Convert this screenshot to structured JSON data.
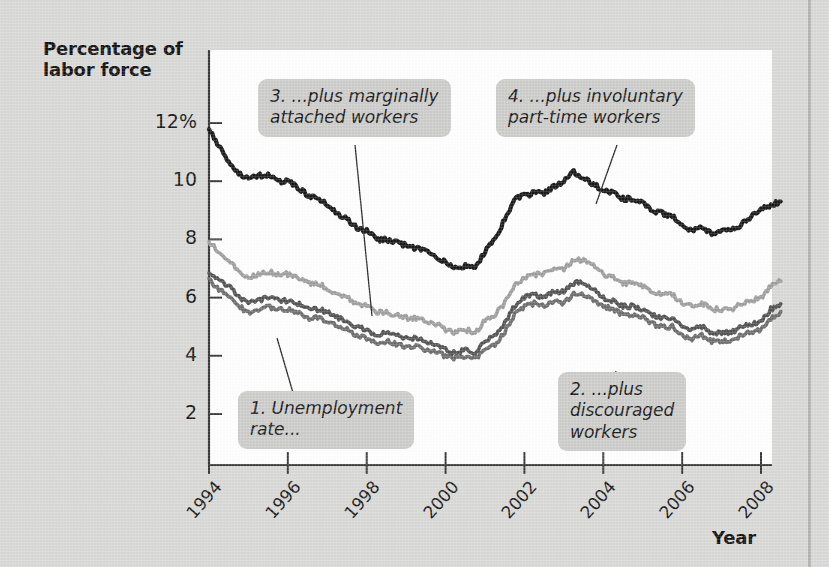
{
  "figure": {
    "background_color": "#d9d9d7",
    "plot_background_color": "#ffffff"
  },
  "axes": {
    "y_title": "Percentage of\nlabor force",
    "x_title": "Year"
  },
  "callouts": [
    {
      "id": "callout-1",
      "text": "1. Unemployment\nrate..."
    },
    {
      "id": "callout-2",
      "text": "2. ...plus\ndiscouraged\nworkers"
    },
    {
      "id": "callout-3",
      "text": "3. ...plus marginally\nattached workers"
    },
    {
      "id": "callout-4",
      "text": "4. ...plus involuntary\npart-time workers"
    }
  ],
  "chart_data": {
    "type": "line",
    "title": "",
    "subtitle": "",
    "xlabel": "Year",
    "ylabel": "Percentage of labor force",
    "xlim": [
      1994.0,
      2008.75
    ],
    "ylim": [
      0.4,
      12.4
    ],
    "ytick_labels": [
      "12%",
      "10",
      "8",
      "6",
      "4",
      "2"
    ],
    "yticks": [
      12,
      10,
      8,
      6,
      4,
      2
    ],
    "xticks": [
      1994,
      1996,
      1998,
      2000,
      2002,
      2004,
      2006,
      2008
    ],
    "xtick_labels": [
      "1994",
      "1996",
      "1998",
      "2000",
      "2002",
      "2004",
      "2006",
      "2008"
    ],
    "grid": false,
    "legend": "callout-annotations",
    "x": [
      1994.0,
      1994.25,
      1994.5,
      1994.75,
      1995.0,
      1995.25,
      1995.5,
      1995.75,
      1996.0,
      1996.25,
      1996.5,
      1996.75,
      1997.0,
      1997.25,
      1997.5,
      1997.75,
      1998.0,
      1998.25,
      1998.5,
      1998.75,
      1999.0,
      1999.25,
      1999.5,
      1999.75,
      2000.0,
      2000.25,
      2000.5,
      2000.75,
      2001.0,
      2001.25,
      2001.5,
      2001.75,
      2002.0,
      2002.25,
      2002.5,
      2002.75,
      2003.0,
      2003.25,
      2003.5,
      2003.75,
      2004.0,
      2004.25,
      2004.5,
      2004.75,
      2005.0,
      2005.25,
      2005.5,
      2005.75,
      2006.0,
      2006.25,
      2006.5,
      2006.75,
      2007.0,
      2007.25,
      2007.5,
      2007.75,
      2008.0,
      2008.25,
      2008.5
    ],
    "series": [
      {
        "name": "1. Unemployment rate (U-3)",
        "color": "#6e6e6e",
        "values": [
          6.6,
          6.3,
          6.1,
          5.7,
          5.5,
          5.6,
          5.7,
          5.6,
          5.6,
          5.5,
          5.3,
          5.3,
          5.2,
          5.0,
          4.9,
          4.7,
          4.6,
          4.4,
          4.5,
          4.4,
          4.3,
          4.3,
          4.2,
          4.1,
          4.0,
          3.9,
          4.0,
          3.9,
          4.2,
          4.4,
          4.8,
          5.4,
          5.7,
          5.8,
          5.7,
          5.9,
          5.8,
          6.1,
          6.1,
          5.9,
          5.7,
          5.6,
          5.4,
          5.4,
          5.3,
          5.1,
          5.0,
          5.0,
          4.7,
          4.6,
          4.7,
          4.5,
          4.5,
          4.5,
          4.7,
          4.8,
          4.9,
          5.3,
          5.5
        ]
      },
      {
        "name": "2. ...plus discouraged workers (U-4)",
        "color": "#545454",
        "values": [
          6.9,
          6.6,
          6.4,
          6.0,
          5.8,
          5.9,
          6.0,
          5.9,
          5.9,
          5.8,
          5.6,
          5.6,
          5.5,
          5.3,
          5.2,
          5.0,
          4.9,
          4.7,
          4.8,
          4.7,
          4.6,
          4.6,
          4.5,
          4.4,
          4.2,
          4.1,
          4.2,
          4.1,
          4.5,
          4.7,
          5.1,
          5.7,
          6.0,
          6.1,
          6.0,
          6.2,
          6.2,
          6.5,
          6.5,
          6.3,
          6.0,
          5.9,
          5.7,
          5.7,
          5.6,
          5.4,
          5.3,
          5.3,
          5.0,
          4.9,
          5.0,
          4.8,
          4.8,
          4.8,
          5.0,
          5.1,
          5.2,
          5.6,
          5.8
        ]
      },
      {
        "name": "3. ...plus marginally attached workers (U-5)",
        "color": "#9f9f9f",
        "values": [
          7.9,
          7.6,
          7.3,
          6.9,
          6.7,
          6.8,
          6.9,
          6.8,
          6.8,
          6.7,
          6.5,
          6.5,
          6.3,
          6.1,
          6.0,
          5.8,
          5.7,
          5.5,
          5.5,
          5.4,
          5.3,
          5.3,
          5.2,
          5.1,
          4.9,
          4.8,
          4.9,
          4.8,
          5.2,
          5.4,
          5.8,
          6.4,
          6.7,
          6.8,
          6.8,
          7.0,
          7.0,
          7.3,
          7.3,
          7.1,
          6.8,
          6.7,
          6.5,
          6.5,
          6.4,
          6.2,
          6.1,
          6.1,
          5.8,
          5.7,
          5.8,
          5.6,
          5.6,
          5.6,
          5.8,
          5.9,
          6.0,
          6.4,
          6.6
        ]
      },
      {
        "name": "4. ...plus involuntary part-time workers (U-6)",
        "color": "#1a1a1a",
        "values": [
          11.8,
          11.2,
          10.7,
          10.3,
          10.1,
          10.2,
          10.2,
          10.0,
          10.0,
          9.8,
          9.5,
          9.4,
          9.2,
          8.9,
          8.7,
          8.4,
          8.3,
          8.0,
          8.0,
          7.9,
          7.8,
          7.7,
          7.6,
          7.4,
          7.2,
          7.0,
          7.1,
          7.0,
          7.6,
          8.0,
          8.7,
          9.4,
          9.5,
          9.6,
          9.6,
          9.8,
          10.0,
          10.3,
          10.1,
          9.9,
          9.7,
          9.6,
          9.4,
          9.4,
          9.3,
          9.0,
          8.9,
          8.8,
          8.5,
          8.3,
          8.4,
          8.2,
          8.3,
          8.3,
          8.5,
          8.8,
          9.0,
          9.2,
          9.3
        ]
      }
    ]
  }
}
